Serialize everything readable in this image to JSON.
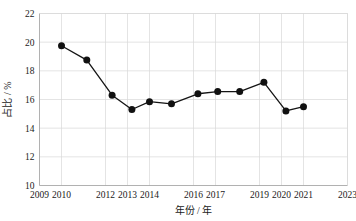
{
  "chart_data": {
    "type": "line",
    "title": "",
    "subtitle": "",
    "xlabel": "年份 / 年",
    "ylabel": "占比 / %",
    "xlim": [
      2009,
      2023
    ],
    "ylim": [
      10,
      22
    ],
    "grid": true,
    "legend": null,
    "legend_position": "none",
    "xticks": [
      2009,
      2010,
      2012,
      2013,
      2014,
      2016,
      2017,
      2019,
      2020,
      2021,
      2023
    ],
    "xtick_labels": [
      "2009",
      "2010",
      "2012",
      "2013",
      "2014",
      "2016",
      "2017",
      "2019",
      "2020",
      "2021",
      "2023"
    ],
    "yticks": [
      10,
      12,
      14,
      16,
      18,
      20,
      22
    ],
    "ytick_labels": [
      "10",
      "12",
      "14",
      "16",
      "18",
      "20",
      "22"
    ],
    "marker": "circle",
    "marker_color": "#111111",
    "line_color": "#141414",
    "x": [
      2010.0,
      2011.15,
      2012.3,
      2013.2,
      2014.0,
      2015.0,
      2016.2,
      2017.1,
      2018.1,
      2019.2,
      2020.2,
      2021.0
    ],
    "values": [
      19.75,
      18.75,
      16.3,
      15.3,
      15.85,
      15.7,
      16.4,
      16.55,
      16.55,
      17.2,
      15.2,
      15.5
    ],
    "points": [
      {
        "x": 2010.0,
        "y": 19.75
      },
      {
        "x": 2011.15,
        "y": 18.75
      },
      {
        "x": 2012.3,
        "y": 16.3
      },
      {
        "x": 2013.2,
        "y": 15.3
      },
      {
        "x": 2014.0,
        "y": 15.85
      },
      {
        "x": 2015.0,
        "y": 15.7
      },
      {
        "x": 2016.2,
        "y": 16.4
      },
      {
        "x": 2017.1,
        "y": 16.55
      },
      {
        "x": 2018.1,
        "y": 16.55
      },
      {
        "x": 2019.2,
        "y": 17.2
      },
      {
        "x": 2020.2,
        "y": 15.2
      },
      {
        "x": 2021.0,
        "y": 15.5
      }
    ]
  }
}
